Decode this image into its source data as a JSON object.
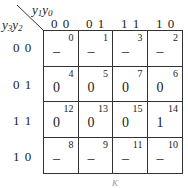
{
  "kmap": {
    "col_var_label": "y1y0",
    "row_var_label": "y3y2",
    "col_vars": [
      "y1",
      "y0"
    ],
    "row_vars": [
      "y3",
      "y2"
    ],
    "col_headers": [
      "0 0",
      "0 1",
      "1 1",
      "1 0"
    ],
    "row_headers": [
      "0 0",
      "0 1",
      "1 1",
      "1 0"
    ],
    "cells": [
      [
        {
          "index": "0",
          "value": "–"
        },
        {
          "index": "1",
          "value": "–"
        },
        {
          "index": "3",
          "value": "–"
        },
        {
          "index": "2",
          "value": "–"
        }
      ],
      [
        {
          "index": "4",
          "value": "0"
        },
        {
          "index": "5",
          "value": "0"
        },
        {
          "index": "7",
          "value": "0"
        },
        {
          "index": "6",
          "value": "0"
        }
      ],
      [
        {
          "index": "12",
          "value": "0"
        },
        {
          "index": "13",
          "value": "0"
        },
        {
          "index": "15",
          "value": "0"
        },
        {
          "index": "14",
          "value": "1"
        }
      ],
      [
        {
          "index": "8",
          "value": "–"
        },
        {
          "index": "9",
          "value": "–"
        },
        {
          "index": "11",
          "value": "–"
        },
        {
          "index": "10",
          "value": "–"
        }
      ]
    ],
    "footer_label": "K"
  }
}
